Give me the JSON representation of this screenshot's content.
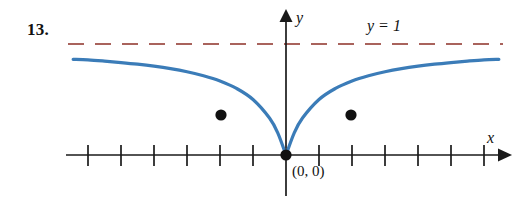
{
  "figure": {
    "problem_number": "13.",
    "origin_label": "(0, 0)",
    "asymptote_label": "y = 1",
    "axis_label_x": "x",
    "axis_label_y": "y",
    "colors": {
      "curve": "#3b7cb8",
      "asymptote": "#a9635c",
      "axis": "#1a1a1a",
      "point": "#111111",
      "background": "#ffffff"
    }
  },
  "chart_data": {
    "type": "line",
    "title": "",
    "subtitle": "",
    "xlabel": "x",
    "ylabel": "y",
    "grid": false,
    "legend_position": "none",
    "xlim": [
      -6.5,
      6.5
    ],
    "ylim": [
      -0.35,
      1.35
    ],
    "x_tick_values": [
      -6,
      -5,
      -4,
      -3,
      -2,
      -1,
      1,
      2,
      3,
      4,
      5,
      6
    ],
    "x_tick_labels": [
      "",
      "",
      "",
      "",
      "",
      "",
      "",
      "",
      "",
      "",
      "",
      ""
    ],
    "y_tick_values": [],
    "y_tick_labels": [],
    "axes_arrows": [
      "x-positive",
      "y-positive"
    ],
    "series": [
      {
        "name": "curve",
        "style": "solid",
        "color": "#3b7cb8",
        "x": [
          -6.45,
          -6.0,
          -5.5,
          -5.0,
          -4.5,
          -4.0,
          -3.5,
          -3.0,
          -2.5,
          -2.0,
          -1.5,
          -1.0,
          -0.5,
          -0.25,
          0.0,
          0.25,
          0.5,
          1.0,
          1.5,
          2.0,
          2.5,
          3.0,
          3.5,
          4.0,
          4.5,
          5.0,
          5.5,
          6.0,
          6.45
        ],
        "y": [
          0.862,
          0.857,
          0.846,
          0.833,
          0.818,
          0.8,
          0.778,
          0.75,
          0.714,
          0.667,
          0.6,
          0.5,
          0.333,
          0.2,
          0.0,
          0.2,
          0.333,
          0.5,
          0.6,
          0.667,
          0.714,
          0.75,
          0.778,
          0.8,
          0.818,
          0.833,
          0.846,
          0.857,
          0.862
        ]
      },
      {
        "name": "asymptote",
        "style": "dashed",
        "color": "#a9635c",
        "x": [
          -6.6,
          6.55
        ],
        "y": [
          1.0,
          1.0
        ]
      }
    ],
    "annotations": [
      {
        "name": "asymptote-label",
        "text": "y = 1",
        "x": 2.6,
        "y": 1.2
      },
      {
        "name": "origin-point-label",
        "text": "(0, 0)",
        "x": 0.25,
        "y": -0.12
      },
      {
        "name": "x-axis-label",
        "text": "x",
        "x": 6.3,
        "y": 0.14
      },
      {
        "name": "y-axis-label",
        "text": "y",
        "x": 0.33,
        "y": 1.32
      }
    ],
    "marked_points": [
      {
        "name": "left-marked-point",
        "x": -2.0,
        "y": 0.5,
        "label": ""
      },
      {
        "name": "origin-point",
        "x": 0.0,
        "y": 0.0,
        "label": "(0, 0)"
      },
      {
        "name": "right-marked-point",
        "x": 2.0,
        "y": 0.5,
        "label": ""
      }
    ]
  }
}
